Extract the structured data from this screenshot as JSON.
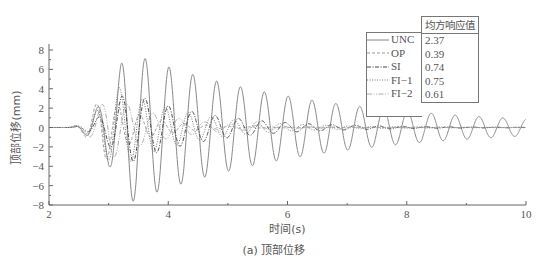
{
  "chart_data": {
    "type": "line",
    "title": "",
    "xlabel": "时间(s)",
    "ylabel": "顶部位移(mm)",
    "xlim": [
      2,
      10
    ],
    "ylim": [
      -8,
      8
    ],
    "xticks": [
      2,
      4,
      6,
      8,
      10
    ],
    "yticks": [
      -8,
      -6,
      -4,
      -2,
      0,
      2,
      4,
      6,
      8
    ],
    "grid": false,
    "legend_position": "upper right",
    "legend_header": "均方响应值",
    "series": [
      {
        "name": "UNC",
        "rms": "2.37",
        "style": "solid",
        "color": "#888888",
        "description": "Lightly damped oscillation, period ~0.4s, peaks ~7.8 near t=3.2-3.9s decaying to ~0.6 at t=10s"
      },
      {
        "name": "OP",
        "rms": "0.39",
        "style": "dashed",
        "color": "#999999",
        "description": "Strongly controlled response, peak ~4 near t=3s, decays to ~0 by t=5s"
      },
      {
        "name": "SI",
        "rms": "0.74",
        "style": "dash-dot",
        "color": "#444444",
        "description": "Controlled response, peaks ~3.8 near t=3.8s, decays to ~0 by t=7.5s"
      },
      {
        "name": "FI-1",
        "rms": "0.75",
        "style": "dotted",
        "color": "#777777",
        "description": "Controlled response, peaks ~4.5 near t=3.2s, decays to ~0 by t=7.5s"
      },
      {
        "name": "FI-2",
        "rms": "0.61",
        "style": "dash-dot-dot",
        "color": "#aaaaaa",
        "description": "Controlled response, peaks ~3.5 near t=3.2s, decays to ~0 by t=6s"
      }
    ],
    "sampled_peaks_UNC": {
      "t": [
        2.4,
        2.65,
        2.85,
        3.05,
        3.25,
        3.45,
        3.65,
        3.85,
        4.05,
        4.25,
        4.5,
        4.7,
        5.0,
        5.5,
        6.0,
        6.5,
        7.0,
        7.5,
        8.0,
        8.5,
        9.0,
        9.5,
        9.9
      ],
      "y": [
        0.9,
        -2.9,
        4.2,
        -6.2,
        7.8,
        -7.8,
        7.2,
        -7.7,
        7.7,
        -6.6,
        6.7,
        -6.7,
        6.2,
        5.5,
        4.5,
        3.6,
        3.0,
        2.4,
        1.8,
        1.4,
        1.0,
        0.8,
        0.6
      ]
    }
  },
  "caption": "(a) 顶部位移",
  "legend": {
    "header": "均方响应值",
    "items": [
      {
        "name": "UNC",
        "value": "2.37"
      },
      {
        "name": "OP",
        "value": "0.39"
      },
      {
        "name": "SI",
        "value": "0.74"
      },
      {
        "name": "FI−1",
        "value": "0.75"
      },
      {
        "name": "FI−2",
        "value": "0.61"
      }
    ]
  }
}
